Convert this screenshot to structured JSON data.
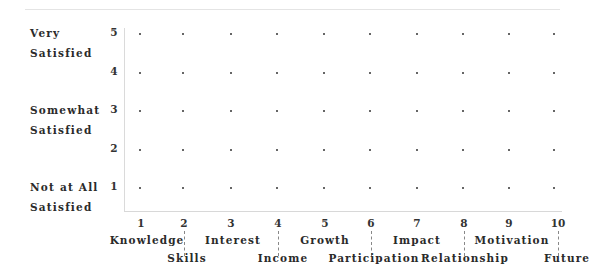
{
  "chart_data": {
    "type": "scatter",
    "title": "",
    "xlabel": "",
    "ylabel": "",
    "xlim": [
      1,
      10
    ],
    "ylim": [
      1,
      5
    ],
    "grid": "dot-matrix (every integer x and y)",
    "x_ticks": [
      "1",
      "2",
      "3",
      "4",
      "5",
      "6",
      "7",
      "8",
      "9",
      "10"
    ],
    "y_ticks": [
      "1",
      "2",
      "3",
      "4",
      "5"
    ],
    "x_categories": [
      {
        "value": 1,
        "label": "Knowledge"
      },
      {
        "value": 2,
        "label": "Skills"
      },
      {
        "value": 3,
        "label": "Interest"
      },
      {
        "value": 4,
        "label": "Income"
      },
      {
        "value": 5,
        "label": "Growth"
      },
      {
        "value": 6,
        "label": "Participation"
      },
      {
        "value": 7,
        "label": "Impact"
      },
      {
        "value": 8,
        "label": "Relationship"
      },
      {
        "value": 9,
        "label": "Motivation"
      },
      {
        "value": 10,
        "label": "Future"
      }
    ],
    "y_categories": [
      {
        "value": 5,
        "label": "Very Satisfied"
      },
      {
        "value": 3,
        "label": "Somewhat Satisfied"
      },
      {
        "value": 1,
        "label": "Not at All Satisfied"
      }
    ],
    "series": []
  },
  "y_labels": {
    "very": [
      "Very",
      "Satisfied"
    ],
    "somewhat": [
      "Somewhat",
      "Satisfied"
    ],
    "not_at_all": [
      "Not at All",
      "Satisfied"
    ]
  },
  "y_ticks": [
    "5",
    "4",
    "3",
    "2",
    "1"
  ],
  "x_ticks": [
    "1",
    "2",
    "3",
    "4",
    "5",
    "6",
    "7",
    "8",
    "9",
    "10"
  ],
  "x_labels": [
    "Knowledge",
    "Skills",
    "Interest",
    "Income",
    "Growth",
    "Participation",
    "Impact",
    "Relationship",
    "Motivation",
    "Future"
  ]
}
